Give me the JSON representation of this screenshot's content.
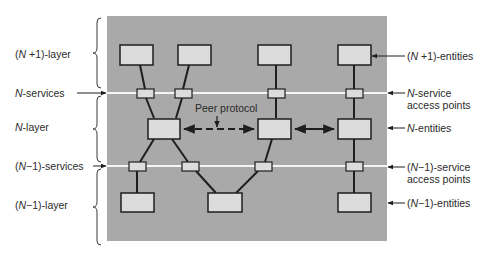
{
  "diagram": {
    "colors": {
      "panel": "#a9a9a9",
      "box_fill": "#dcdcdc",
      "box_stroke": "#1e1e1e",
      "service_line": "#f4f4f4",
      "text": "#2a2a2a"
    },
    "left_labels": {
      "n_plus_1_layer": {
        "prefix": "(",
        "var": "N",
        "suffix": " +1)-layer"
      },
      "n_services": {
        "prefix": "",
        "var": "N",
        "suffix": "-services"
      },
      "n_layer": {
        "prefix": "",
        "var": "N",
        "suffix": "-layer"
      },
      "n_minus_1_services": {
        "prefix": "(",
        "var": "N",
        "suffix": "−1)-services"
      },
      "n_minus_1_layer": {
        "prefix": "(",
        "var": "N",
        "suffix": "−1)-layer"
      }
    },
    "right_labels": {
      "n_plus_1_entities": {
        "prefix": "(",
        "var": "N",
        "suffix": " +1)-entities"
      },
      "n_sap_line1": {
        "prefix": "",
        "var": "N",
        "suffix": "-service"
      },
      "n_sap_line2": "access points",
      "n_entities": {
        "prefix": "",
        "var": "N",
        "suffix": "-entities"
      },
      "n_minus_1_sap_line1": {
        "prefix": "(",
        "var": "N",
        "suffix": "−1)-service"
      },
      "n_minus_1_sap_line2": "access points",
      "n_minus_1_entities": {
        "prefix": "(",
        "var": "N",
        "suffix": "−1)-entities"
      }
    },
    "peer_protocol_label": "Peer protocol",
    "layers": [
      "(N+1)-layer",
      "N-layer",
      "(N-1)-layer"
    ],
    "entities": {
      "n_plus_1": 4,
      "n": 3,
      "n_minus_1": 3
    },
    "service_access_points": {
      "n": 4,
      "n_minus_1": 4
    }
  }
}
